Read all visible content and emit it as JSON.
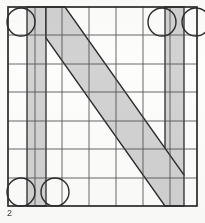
{
  "figure": {
    "number": "2",
    "colors": {
      "background": "#fdfdfc",
      "grid_line": "#4a4a4a",
      "border_line": "#2b2b2b",
      "band_fill": "#d2d2d2",
      "band_stroke": "#2b2b2b",
      "circle_stroke": "#2b2b2b",
      "caption_text": "#3b3b3b"
    },
    "canvas": {
      "width": 205,
      "height": 223
    },
    "grid": {
      "left": 8,
      "top": 7,
      "right": 197,
      "bottom": 206,
      "columns": 7,
      "rows": 7,
      "x_lines": [
        8,
        35,
        62,
        89,
        116,
        143,
        170,
        197
      ],
      "y_lines": [
        7,
        35,
        64,
        92,
        121,
        149,
        178,
        206
      ],
      "grid_stroke_width": 0.9,
      "border_stroke_width": 1.7,
      "grid_visible": true
    },
    "bands": [
      {
        "name": "left-vertical-band",
        "shape": "rect",
        "x": 27,
        "y": 7,
        "width": 19,
        "height": 199,
        "fill": "#d2d2d2"
      },
      {
        "name": "right-vertical-band",
        "shape": "rect",
        "x": 165,
        "y": 7,
        "width": 19,
        "height": 168,
        "fill": "#d2d2d2"
      },
      {
        "name": "diagonal-band",
        "shape": "polygon",
        "points": "46,7 65,7 184,175 184,206 165,206 46,38",
        "fill": "#d2d2d2"
      }
    ],
    "circles": [
      {
        "name": "circle-top-left",
        "cx": 21,
        "cy": 22,
        "r": 14
      },
      {
        "name": "circle-top-right",
        "cx": 162,
        "cy": 22,
        "r": 14
      },
      {
        "name": "circle-top-far-right",
        "cx": 196,
        "cy": 22,
        "r": 14
      },
      {
        "name": "circle-bottom-left",
        "cx": 21,
        "cy": 192,
        "r": 14
      },
      {
        "name": "circle-bottom-mid",
        "cx": 55,
        "cy": 192,
        "r": 14
      }
    ]
  }
}
